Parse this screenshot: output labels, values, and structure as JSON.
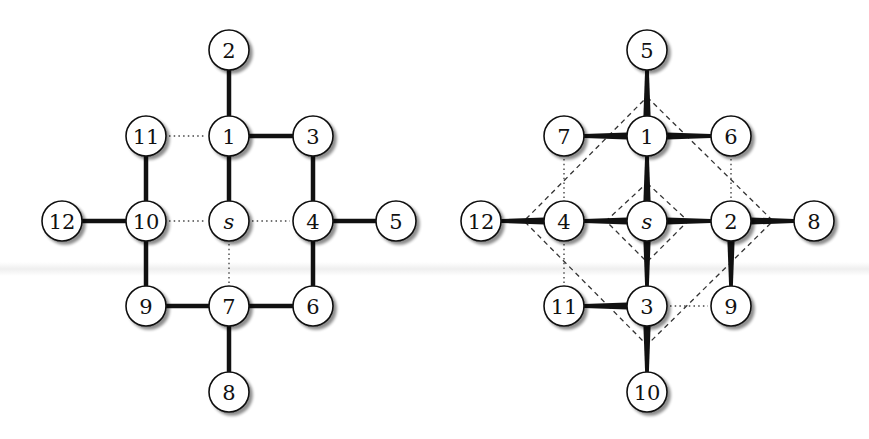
{
  "figure": {
    "panels": [
      {
        "id": "left",
        "title": "",
        "offset_x": 0,
        "nodes": [
          {
            "id": "s",
            "label": "s",
            "italic": true,
            "x": 229,
            "y": 221
          },
          {
            "id": "1",
            "label": "1",
            "italic": false,
            "x": 229,
            "y": 136
          },
          {
            "id": "2",
            "label": "2",
            "italic": false,
            "x": 229,
            "y": 50
          },
          {
            "id": "3",
            "label": "3",
            "italic": false,
            "x": 313,
            "y": 136
          },
          {
            "id": "4",
            "label": "4",
            "italic": false,
            "x": 313,
            "y": 221
          },
          {
            "id": "5",
            "label": "5",
            "italic": false,
            "x": 396,
            "y": 221
          },
          {
            "id": "6",
            "label": "6",
            "italic": false,
            "x": 313,
            "y": 306
          },
          {
            "id": "7",
            "label": "7",
            "italic": false,
            "x": 229,
            "y": 306
          },
          {
            "id": "8",
            "label": "8",
            "italic": false,
            "x": 229,
            "y": 392
          },
          {
            "id": "9",
            "label": "9",
            "italic": false,
            "x": 146,
            "y": 306
          },
          {
            "id": "10",
            "label": "10",
            "italic": false,
            "x": 146,
            "y": 221
          },
          {
            "id": "11",
            "label": "11",
            "italic": false,
            "x": 146,
            "y": 136
          },
          {
            "id": "12",
            "label": "12",
            "italic": false,
            "x": 62,
            "y": 221
          }
        ],
        "edges": [
          {
            "from": "s",
            "to": "1",
            "style": "solid"
          },
          {
            "from": "1",
            "to": "2",
            "style": "solid"
          },
          {
            "from": "1",
            "to": "3",
            "style": "solid"
          },
          {
            "from": "3",
            "to": "4",
            "style": "solid"
          },
          {
            "from": "4",
            "to": "5",
            "style": "solid"
          },
          {
            "from": "4",
            "to": "6",
            "style": "solid"
          },
          {
            "from": "6",
            "to": "7",
            "style": "solid"
          },
          {
            "from": "7",
            "to": "8",
            "style": "solid"
          },
          {
            "from": "7",
            "to": "9",
            "style": "solid"
          },
          {
            "from": "9",
            "to": "10",
            "style": "solid"
          },
          {
            "from": "10",
            "to": "11",
            "style": "solid"
          },
          {
            "from": "10",
            "to": "12",
            "style": "solid"
          },
          {
            "from": "11",
            "to": "1",
            "style": "dotted"
          },
          {
            "from": "10",
            "to": "s",
            "style": "dotted"
          },
          {
            "from": "s",
            "to": "4",
            "style": "dotted"
          },
          {
            "from": "s",
            "to": "7",
            "style": "dotted"
          }
        ],
        "dashed_polygons": []
      },
      {
        "id": "right",
        "title": "",
        "offset_x": 0,
        "nodes": [
          {
            "id": "s",
            "label": "s",
            "italic": true,
            "x": 647,
            "y": 221
          },
          {
            "id": "1",
            "label": "1",
            "italic": false,
            "x": 647,
            "y": 136
          },
          {
            "id": "2",
            "label": "2",
            "italic": false,
            "x": 731,
            "y": 221
          },
          {
            "id": "3",
            "label": "3",
            "italic": false,
            "x": 647,
            "y": 306
          },
          {
            "id": "4",
            "label": "4",
            "italic": false,
            "x": 564,
            "y": 221
          },
          {
            "id": "5",
            "label": "5",
            "italic": false,
            "x": 647,
            "y": 50
          },
          {
            "id": "6",
            "label": "6",
            "italic": false,
            "x": 731,
            "y": 136
          },
          {
            "id": "7",
            "label": "7",
            "italic": false,
            "x": 564,
            "y": 136
          },
          {
            "id": "8",
            "label": "8",
            "italic": false,
            "x": 814,
            "y": 221
          },
          {
            "id": "9",
            "label": "9",
            "italic": false,
            "x": 731,
            "y": 306
          },
          {
            "id": "10",
            "label": "10",
            "italic": false,
            "x": 647,
            "y": 392
          },
          {
            "id": "11",
            "label": "11",
            "italic": false,
            "x": 564,
            "y": 306
          },
          {
            "id": "12",
            "label": "12",
            "italic": false,
            "x": 481,
            "y": 221
          }
        ],
        "edges": [
          {
            "from": "s",
            "to": "1",
            "style": "taper"
          },
          {
            "from": "s",
            "to": "2",
            "style": "taper"
          },
          {
            "from": "s",
            "to": "3",
            "style": "taper"
          },
          {
            "from": "s",
            "to": "4",
            "style": "taper"
          },
          {
            "from": "1",
            "to": "5",
            "style": "taper"
          },
          {
            "from": "1",
            "to": "6",
            "style": "taper"
          },
          {
            "from": "1",
            "to": "7",
            "style": "taper"
          },
          {
            "from": "2",
            "to": "8",
            "style": "taper"
          },
          {
            "from": "2",
            "to": "9",
            "style": "taper"
          },
          {
            "from": "3",
            "to": "10",
            "style": "taper"
          },
          {
            "from": "3",
            "to": "11",
            "style": "taper"
          },
          {
            "from": "4",
            "to": "12",
            "style": "taper"
          },
          {
            "from": "7",
            "to": "4",
            "style": "dotted"
          },
          {
            "from": "6",
            "to": "2",
            "style": "dotted"
          },
          {
            "from": "4",
            "to": "11",
            "style": "dotted"
          },
          {
            "from": "3",
            "to": "9",
            "style": "dotted"
          }
        ],
        "dashed_polygons": [
          {
            "name": "outer-diamond",
            "points": [
              [
                647,
                97
              ],
              [
                773,
                221
              ],
              [
                647,
                345
              ],
              [
                524,
                221
              ]
            ]
          },
          {
            "name": "inner-diamond",
            "points": [
              [
                647,
                183
              ],
              [
                688,
                221
              ],
              [
                647,
                262
              ],
              [
                606,
                221
              ]
            ]
          }
        ]
      }
    ],
    "node_radius": 20,
    "colors": {
      "stroke": "#111111",
      "node_fill": "#ffffff",
      "shadow": "#9a9a9a"
    }
  }
}
